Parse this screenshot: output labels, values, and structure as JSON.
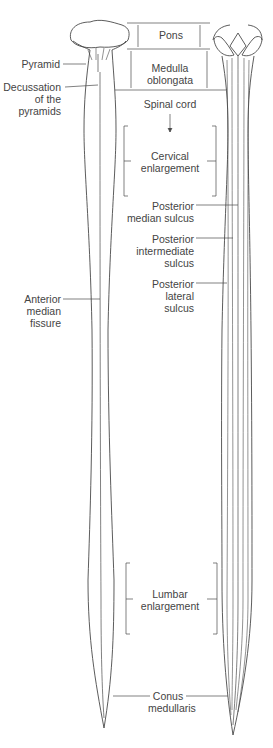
{
  "colors": {
    "outline": "#4a4a4a",
    "text": "#444444",
    "background": "#ffffff"
  },
  "labels": {
    "pons": "Pons",
    "medulla": "Medulla\noblongata",
    "spinal_cord": "Spinal cord",
    "pyramid": "Pyramid",
    "decussation": "Decussation\nof the\npyramids",
    "cervical": "Cervical\nenlargement",
    "post_median": "Posterior\nmedian sulcus",
    "post_intermediate": "Posterior\nintermediate\nsulcus",
    "post_lateral": "Posterior\nlateral\nsulcus",
    "anterior_fissure": "Anterior\nmedian\nfissure",
    "lumbar": "Lumbar\nenlargement",
    "conus": "Conus\nmedullaris"
  },
  "views": [
    {
      "name": "anterior-view",
      "side": "left"
    },
    {
      "name": "posterior-view",
      "side": "right"
    }
  ]
}
